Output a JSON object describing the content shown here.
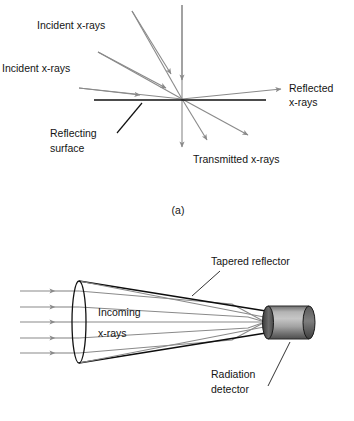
{
  "figure": {
    "panel_a": {
      "caption": "(a)",
      "labels": {
        "incident_upper": "Incident x-rays",
        "incident_lower": "Incident x-rays",
        "reflected_line1": "Reflected",
        "reflected_line2": "x-rays",
        "reflecting_line1": "Reflecting",
        "reflecting_line2": "surface",
        "transmitted": "Transmitted x-rays"
      }
    },
    "panel_b": {
      "labels": {
        "tapered_reflector": "Tapered reflector",
        "incoming_line1": "Incoming",
        "incoming_line2": "x-rays",
        "radiation_line1": "Radiation",
        "radiation_line2": "detector"
      }
    },
    "colors": {
      "ray": "#8a8a8a",
      "outline": "#0d0d0d",
      "text": "#141414",
      "detector_light": "#b9b9b9",
      "detector_mid": "#8d8d8d",
      "detector_dark": "#4a4a4a",
      "background": "#ffffff"
    }
  }
}
